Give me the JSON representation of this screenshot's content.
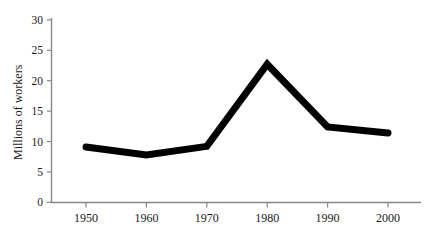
{
  "chart_data": {
    "type": "line",
    "title": "",
    "subtitle": "",
    "xlabel": "",
    "ylabel": "Millions of workers",
    "categories": [
      "1950",
      "1960",
      "1970",
      "1980",
      "1990",
      "2000"
    ],
    "x": [
      1950,
      1960,
      1970,
      1980,
      1990,
      2000
    ],
    "values": [
      9.1,
      7.8,
      9.2,
      22.7,
      12.4,
      11.4
    ],
    "series": [
      {
        "name": "Millions of workers",
        "values": [
          9.1,
          7.8,
          9.2,
          22.7,
          12.4,
          11.4
        ]
      }
    ],
    "xlim": [
      1945,
      2005
    ],
    "ylim": [
      0,
      30
    ],
    "yticks": [
      0,
      5,
      10,
      15,
      20,
      25,
      30
    ],
    "ytick_labels": [
      "0",
      "5",
      "10",
      "15",
      "20",
      "25",
      "30"
    ],
    "xticks": [
      1950,
      1960,
      1970,
      1980,
      1990,
      2000
    ],
    "xtick_labels": [
      "1950",
      "1960",
      "1970",
      "1980",
      "1990",
      "2000"
    ],
    "grid": false,
    "legend": false,
    "legend_position": "none",
    "line_color": "#000000",
    "line_width_px": 7,
    "axis_color": "#808080",
    "background_color": "#ffffff",
    "annotations": []
  },
  "axes": {
    "y_axis_label": "Millions of workers",
    "y_tick_0": "0",
    "y_tick_5": "5",
    "y_tick_10": "10",
    "y_tick_15": "15",
    "y_tick_20": "20",
    "y_tick_25": "25",
    "y_tick_30": "30",
    "x_tick_1950": "1950",
    "x_tick_1960": "1960",
    "x_tick_1970": "1970",
    "x_tick_1980": "1980",
    "x_tick_1990": "1990",
    "x_tick_2000": "2000"
  }
}
